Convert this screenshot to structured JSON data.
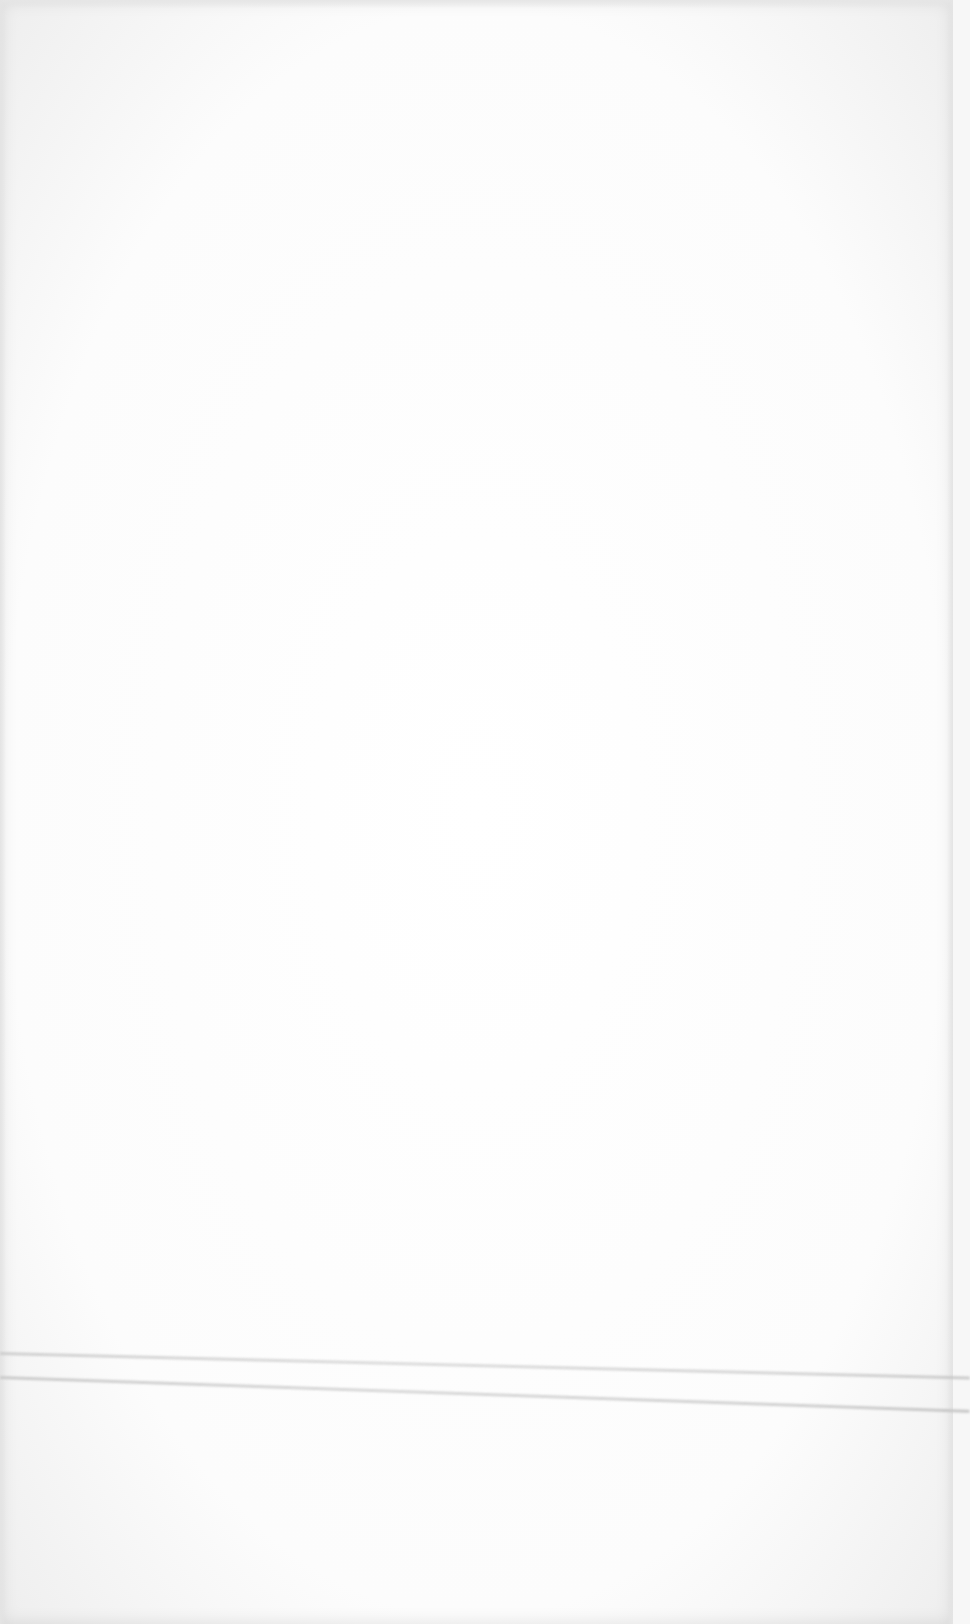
{
  "document": {
    "type": "blank-scanned-page",
    "text_content": "",
    "background_color": "#fdfdfd",
    "line_color": "#cfcfcf"
  }
}
